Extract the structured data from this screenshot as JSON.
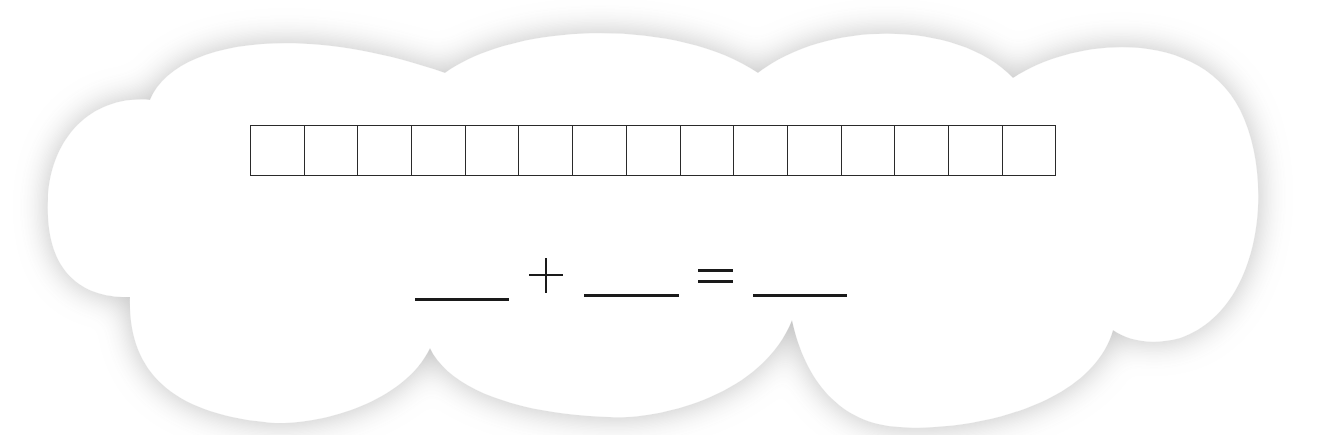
{
  "worksheet": {
    "shape": "cloud",
    "colors": {
      "cloud_fill": "#ffffff",
      "cloud_shadow": "#9a9a9a",
      "line_color": "#1a1a1a",
      "background": "#ffffff"
    },
    "number_grid": {
      "cell_count": 15,
      "cells": [
        "",
        "",
        "",
        "",
        "",
        "",
        "",
        "",
        "",
        "",
        "",
        "",
        "",
        "",
        ""
      ]
    },
    "equation": {
      "blank_1": "",
      "operator_1": "+",
      "blank_2": "",
      "operator_2": "=",
      "blank_3": ""
    }
  }
}
